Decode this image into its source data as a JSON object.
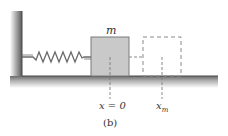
{
  "figure": {
    "caption": "(b)",
    "mass_label": "m",
    "equilibrium_label": "x = 0",
    "max_label_main": "x",
    "max_label_sub": "m"
  },
  "colors": {
    "wall_shade": "#6e6e6e",
    "floor_shade": "#8a8a8a",
    "block_fill": "#c9c9c9",
    "block_stroke": "#7a7a7a",
    "spring": "#6a6a6a",
    "dashed": "#8a8a8a",
    "text": "#333333"
  }
}
